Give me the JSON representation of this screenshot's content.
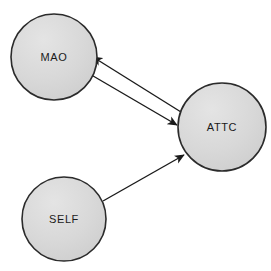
{
  "figure": {
    "type": "path-diagram",
    "background_color": "#ffffff",
    "width": 271,
    "height": 271
  },
  "style": {
    "node_fill": "#d4d4d4",
    "node_fill_highlight": "#e2e2e2",
    "node_stroke": "#2b2b2b",
    "node_stroke_width": 1.6,
    "edge_color": "#1a1a1a",
    "edge_width": 1.4,
    "label_color": "#1a1a1a",
    "label_size": 11
  },
  "nodes": [
    {
      "id": "mao",
      "label": "MAO",
      "cx": 54,
      "cy": 57,
      "r": 43
    },
    {
      "id": "attc",
      "label": "ATTC",
      "cx": 222,
      "cy": 127,
      "r": 44
    },
    {
      "id": "self",
      "label": "SELF",
      "cx": 64,
      "cy": 219,
      "r": 42
    }
  ],
  "edges": [
    {
      "id": "attc-to-mao",
      "from": "attc",
      "to": "mao",
      "label": "",
      "arrowhead": "filled-triangle",
      "direction": "attc -> mao",
      "x1": 181,
      "y1": 112,
      "x2": 93,
      "y2": 57
    },
    {
      "id": "mao-to-attc",
      "from": "mao",
      "to": "attc",
      "label": "",
      "arrowhead": "filled-triangle",
      "direction": "mao -> attc",
      "x1": 88,
      "y1": 73,
      "x2": 177,
      "y2": 125
    },
    {
      "id": "self-to-attc",
      "from": "self",
      "to": "attc",
      "label": "",
      "arrowhead": "filled-triangle",
      "direction": "self -> attc",
      "x1": 103,
      "y1": 201,
      "x2": 184,
      "y2": 155
    }
  ]
}
